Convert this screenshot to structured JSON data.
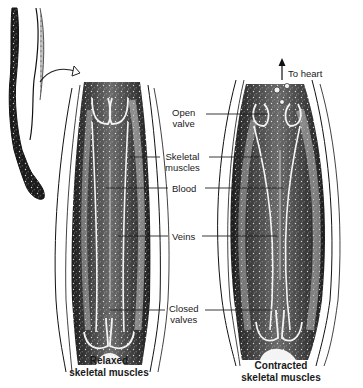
{
  "diagram": {
    "title_context": "Skeletal muscle pump in leg veins",
    "labels": {
      "to_heart": "To heart",
      "open_valve_1": "Open",
      "open_valve_2": "valve",
      "skeletal_muscles_1": "Skeletal",
      "skeletal_muscles_2": "muscles",
      "blood": "Blood",
      "veins": "Veins",
      "closed_valves_1": "Closed",
      "closed_valves_2": "valves"
    },
    "captions": {
      "relaxed_1": "Relaxed",
      "relaxed_2": "skeletal muscles",
      "contracted_1": "Contracted",
      "contracted_2": "skeletal muscles"
    },
    "panels": [
      {
        "name": "relaxed",
        "state": "Relaxed skeletal muscles",
        "valves": "bottom closed"
      },
      {
        "name": "contracted",
        "state": "Contracted skeletal muscles",
        "valves": "top open, bottom closed"
      }
    ],
    "colors": {
      "ink": "#111111",
      "muscle_dark": "#1c1c1c",
      "muscle_mid": "#6a6a6a",
      "background": "#ffffff"
    }
  }
}
